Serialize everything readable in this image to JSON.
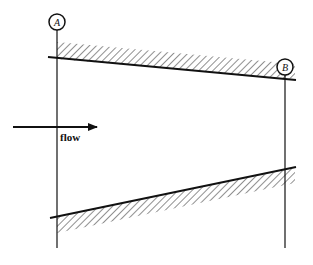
{
  "diagram": {
    "sections": [
      {
        "id": "section-a",
        "label": "A"
      },
      {
        "id": "section-b",
        "label": "B"
      }
    ],
    "arrow_label": "flow",
    "line_color": "#111111"
  }
}
